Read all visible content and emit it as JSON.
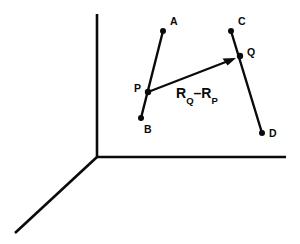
{
  "figure": {
    "type": "vector-diagram",
    "background_color": "#ffffff",
    "ink_color": "#0a0a0a",
    "width": 300,
    "height": 244
  },
  "axes": {
    "origin": {
      "x": 97,
      "y": 157
    },
    "lines": [
      {
        "name": "vertical-axis",
        "x1": 97,
        "y1": 14,
        "x2": 97,
        "y2": 157
      },
      {
        "name": "horizontal-axis",
        "x1": 97,
        "y1": 157,
        "x2": 286,
        "y2": 157
      },
      {
        "name": "depth-axis",
        "x1": 97,
        "y1": 157,
        "x2": 15,
        "y2": 233
      }
    ]
  },
  "points": [
    {
      "id": "A",
      "label": "A",
      "x": 163,
      "y": 31,
      "label_x": 170,
      "label_y": 16
    },
    {
      "id": "B",
      "label": "B",
      "x": 141,
      "y": 118,
      "label_x": 144,
      "label_y": 124
    },
    {
      "id": "C",
      "label": "C",
      "x": 231,
      "y": 31,
      "label_x": 238,
      "label_y": 16
    },
    {
      "id": "D",
      "label": "D",
      "x": 262,
      "y": 133,
      "label_x": 269,
      "label_y": 128
    },
    {
      "id": "P",
      "label": "P",
      "x": 148,
      "y": 92,
      "label_x": 134,
      "label_y": 83
    },
    {
      "id": "Q",
      "label": "Q",
      "x": 240,
      "y": 56,
      "label_x": 247,
      "label_y": 47
    }
  ],
  "segments": [
    {
      "name": "segment-AB",
      "from": "A",
      "to": "B"
    },
    {
      "name": "segment-CD",
      "from": "C",
      "to": "D"
    }
  ],
  "vector": {
    "name": "vector-RQ-minus-RP",
    "from": "P",
    "to": "Q",
    "tail": {
      "x": 148,
      "y": 92
    },
    "tip": {
      "x": 236,
      "y": 58
    },
    "label": {
      "symbol_1": "R",
      "subscript_1": "Q",
      "operator": "–",
      "symbol_2": "R",
      "subscript_2": "P",
      "text": "R Q–R P",
      "x": 176,
      "y": 86
    }
  }
}
